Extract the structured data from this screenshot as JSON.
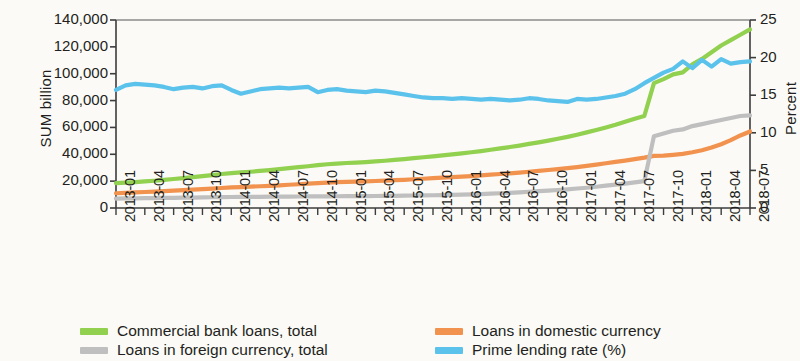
{
  "chart_data": {
    "type": "line",
    "title": "",
    "subtitle": "",
    "xlabel": "",
    "ylabel": "SUM billion",
    "y2label": "Percent",
    "ylim": [
      0,
      140000
    ],
    "y2lim": [
      0,
      25
    ],
    "yticks": [
      "0",
      "20,000",
      "40,000",
      "60,000",
      "80,000",
      "100,000",
      "120,000",
      "140,000"
    ],
    "ytick_values": [
      0,
      20000,
      40000,
      60000,
      80000,
      100000,
      120000,
      140000
    ],
    "y2ticks": [
      "0",
      "5",
      "10",
      "15",
      "20",
      "25"
    ],
    "y2tick_values": [
      0,
      5,
      10,
      15,
      20,
      25
    ],
    "grid": false,
    "legend_position": "bottom",
    "xtick_labels": [
      "2013-01",
      "2013-04",
      "2013-07",
      "2013-10",
      "2014-01",
      "2014-04",
      "2014-07",
      "2014-10",
      "2015-01",
      "2015-04",
      "2015-07",
      "2015-10",
      "2016-01",
      "2016-04",
      "2016-07",
      "2016-10",
      "2017-01",
      "2017-04",
      "2017-07",
      "2017-10",
      "2018-01",
      "2018-04",
      "2018-07"
    ],
    "x": [
      "2013-01",
      "2013-02",
      "2013-03",
      "2013-04",
      "2013-05",
      "2013-06",
      "2013-07",
      "2013-08",
      "2013-09",
      "2013-10",
      "2013-11",
      "2013-12",
      "2014-01",
      "2014-02",
      "2014-03",
      "2014-04",
      "2014-05",
      "2014-06",
      "2014-07",
      "2014-08",
      "2014-09",
      "2014-10",
      "2014-11",
      "2014-12",
      "2015-01",
      "2015-02",
      "2015-03",
      "2015-04",
      "2015-05",
      "2015-06",
      "2015-07",
      "2015-08",
      "2015-09",
      "2015-10",
      "2015-11",
      "2015-12",
      "2016-01",
      "2016-02",
      "2016-03",
      "2016-04",
      "2016-05",
      "2016-06",
      "2016-07",
      "2016-08",
      "2016-09",
      "2016-10",
      "2016-11",
      "2016-12",
      "2017-01",
      "2017-02",
      "2017-03",
      "2017-04",
      "2017-05",
      "2017-06",
      "2017-07",
      "2017-08",
      "2017-09",
      "2017-10",
      "2017-11",
      "2017-12",
      "2018-01",
      "2018-02",
      "2018-03",
      "2018-04",
      "2018-05",
      "2018-06",
      "2018-07"
    ],
    "series": [
      {
        "name": "Commercial bank loans, total",
        "color": "#92D050",
        "axis": "left",
        "unit": "SUM billion",
        "values": [
          18500,
          18900,
          19300,
          19800,
          20300,
          20900,
          21600,
          22300,
          23000,
          23800,
          24500,
          25300,
          26000,
          26500,
          27000,
          27600,
          28200,
          28900,
          29700,
          30400,
          31100,
          31900,
          32600,
          33100,
          33500,
          33800,
          34200,
          34700,
          35200,
          35800,
          36400,
          37100,
          37800,
          38500,
          39200,
          39900,
          40700,
          41500,
          42400,
          43400,
          44400,
          45400,
          46500,
          47700,
          48900,
          50200,
          51600,
          53000,
          54600,
          56300,
          58100,
          60000,
          62000,
          64200,
          66500,
          68500,
          93000,
          96000,
          99500,
          101000,
          107000,
          111000,
          116000,
          121000,
          125000,
          129000,
          133000
        ]
      },
      {
        "name": "Loans in domestic currency",
        "color": "#F1934E",
        "axis": "left",
        "unit": "SUM billion",
        "values": [
          11000,
          11300,
          11600,
          11900,
          12200,
          12500,
          12900,
          13300,
          13700,
          14100,
          14500,
          14900,
          15300,
          15600,
          15900,
          16200,
          16500,
          16900,
          17300,
          17700,
          18100,
          18500,
          18900,
          19200,
          19400,
          19600,
          19800,
          20100,
          20400,
          20700,
          21000,
          21400,
          21800,
          22200,
          22600,
          23000,
          23400,
          23800,
          24300,
          24800,
          25300,
          25800,
          26400,
          27000,
          27600,
          28300,
          29000,
          29700,
          30500,
          31400,
          32300,
          33300,
          34300,
          35300,
          36400,
          37500,
          38800,
          39000,
          39600,
          40300,
          41500,
          43000,
          45000,
          47500,
          50500,
          54000,
          57000
        ]
      },
      {
        "name": "Loans in foreign currency, total",
        "color": "#BFBFBF",
        "axis": "left",
        "unit": "SUM billion",
        "values": [
          7000,
          7100,
          7200,
          7300,
          7400,
          7500,
          7600,
          7700,
          7800,
          7900,
          8000,
          8100,
          8200,
          8250,
          8300,
          8350,
          8400,
          8450,
          8500,
          8550,
          8600,
          8650,
          8700,
          8750,
          8800,
          8850,
          8900,
          8950,
          9000,
          9100,
          9200,
          9300,
          9400,
          9500,
          9600,
          9700,
          9900,
          10100,
          10400,
          10700,
          11000,
          11300,
          11700,
          12100,
          12500,
          12900,
          13400,
          13900,
          14500,
          15100,
          15800,
          16600,
          17400,
          18200,
          19100,
          20000,
          53500,
          55500,
          57500,
          58500,
          61000,
          62500,
          64000,
          65500,
          67000,
          68500,
          69000
        ]
      },
      {
        "name": "Prime lending rate (%)",
        "color": "#5BC2EC",
        "axis": "right",
        "unit": "Percent",
        "values": [
          15.7,
          16.3,
          16.5,
          16.4,
          16.3,
          16.1,
          15.8,
          16.0,
          16.1,
          15.9,
          16.2,
          16.3,
          15.7,
          15.2,
          15.5,
          15.8,
          15.9,
          16.0,
          15.9,
          16.0,
          16.1,
          15.4,
          15.7,
          15.8,
          15.6,
          15.5,
          15.4,
          15.6,
          15.5,
          15.3,
          15.1,
          14.9,
          14.7,
          14.6,
          14.6,
          14.5,
          14.6,
          14.5,
          14.4,
          14.5,
          14.4,
          14.3,
          14.4,
          14.6,
          14.5,
          14.3,
          14.2,
          14.1,
          14.5,
          14.4,
          14.5,
          14.7,
          14.9,
          15.2,
          15.8,
          16.6,
          17.3,
          18.0,
          18.5,
          19.5,
          18.6,
          19.7,
          18.8,
          19.8,
          19.2,
          19.4,
          19.5
        ]
      }
    ]
  },
  "legend": {
    "entries": [
      {
        "label": "Commercial bank loans, total",
        "color": "#92D050"
      },
      {
        "label": "Loans in domestic currency",
        "color": "#F1934E"
      },
      {
        "label": "Loans in foreign currency, total",
        "color": "#BFBFBF"
      },
      {
        "label": "Prime lending rate (%)",
        "color": "#5BC2EC"
      }
    ]
  }
}
